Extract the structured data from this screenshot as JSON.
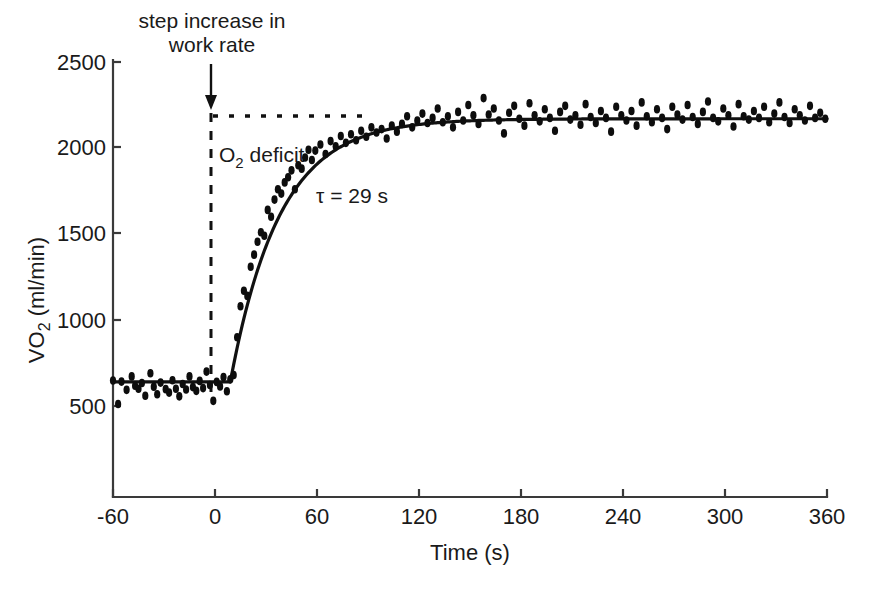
{
  "chart_data": {
    "type": "scatter",
    "title": "",
    "xlabel": "Time (s)",
    "ylabel": "VO2 (ml/min)",
    "ylabel_parts": {
      "main": "VO",
      "sub": "2",
      "units": " (ml/min)"
    },
    "xlim": [
      -60,
      360
    ],
    "ylim": [
      380,
      2560
    ],
    "xticks": [
      -60,
      0,
      60,
      120,
      180,
      240,
      300,
      360
    ],
    "xticklabels": [
      "-60",
      "0",
      "60",
      "120",
      "180",
      "240",
      "300",
      "360"
    ],
    "yticks": [
      500,
      1000,
      1500,
      2000,
      2500
    ],
    "yticklabels": [
      "500",
      "1000",
      "1500",
      "2000",
      "2500"
    ],
    "grid": false,
    "legend": null,
    "series": [
      {
        "name": "VO2 breath-by-breath",
        "marker": "filled-ellipse",
        "color": "#0d0d0d",
        "points": [
          [
            -60,
            648
          ],
          [
            -57,
            512
          ],
          [
            -55,
            642
          ],
          [
            -52,
            594
          ],
          [
            -49,
            672
          ],
          [
            -47,
            618
          ],
          [
            -45,
            600
          ],
          [
            -43,
            634
          ],
          [
            -41,
            560
          ],
          [
            -38,
            690
          ],
          [
            -36,
            612
          ],
          [
            -34,
            568
          ],
          [
            -32,
            636
          ],
          [
            -29,
            598
          ],
          [
            -27,
            578
          ],
          [
            -25,
            650
          ],
          [
            -23,
            600
          ],
          [
            -21,
            556
          ],
          [
            -19,
            628
          ],
          [
            -17,
            596
          ],
          [
            -15,
            672
          ],
          [
            -13,
            610
          ],
          [
            -11,
            588
          ],
          [
            -9,
            646
          ],
          [
            -7,
            604
          ],
          [
            -5,
            700
          ],
          [
            -3,
            622
          ],
          [
            -1,
            530
          ],
          [
            1,
            640
          ],
          [
            3,
            614
          ],
          [
            5,
            668
          ],
          [
            7,
            586
          ],
          [
            9,
            655
          ],
          [
            11,
            680
          ],
          [
            13,
            900
          ],
          [
            15,
            1080
          ],
          [
            17,
            1170
          ],
          [
            19,
            1140
          ],
          [
            21,
            1310
          ],
          [
            23,
            1380
          ],
          [
            25,
            1455
          ],
          [
            27,
            1510
          ],
          [
            29,
            1490
          ],
          [
            31,
            1640
          ],
          [
            33,
            1600
          ],
          [
            35,
            1700
          ],
          [
            37,
            1760
          ],
          [
            39,
            1735
          ],
          [
            41,
            1800
          ],
          [
            43,
            1830
          ],
          [
            45,
            1870
          ],
          [
            47,
            1760
          ],
          [
            49,
            1900
          ],
          [
            51,
            1880
          ],
          [
            53,
            1945
          ],
          [
            55,
            1990
          ],
          [
            57,
            1930
          ],
          [
            59,
            1985
          ],
          [
            62,
            2020
          ],
          [
            65,
            1965
          ],
          [
            68,
            2040
          ],
          [
            71,
            2010
          ],
          [
            74,
            2070
          ],
          [
            77,
            2030
          ],
          [
            80,
            2080
          ],
          [
            83,
            2045
          ],
          [
            86,
            2100
          ],
          [
            89,
            2065
          ],
          [
            92,
            2120
          ],
          [
            95,
            2090
          ],
          [
            98,
            2110
          ],
          [
            101,
            2055
          ],
          [
            104,
            2130
          ],
          [
            107,
            2095
          ],
          [
            110,
            2140
          ],
          [
            113,
            2185
          ],
          [
            116,
            2120
          ],
          [
            119,
            2160
          ],
          [
            122,
            2200
          ],
          [
            125,
            2145
          ],
          [
            128,
            2175
          ],
          [
            131,
            2230
          ],
          [
            134,
            2150
          ],
          [
            137,
            2185
          ],
          [
            140,
            2120
          ],
          [
            143,
            2210
          ],
          [
            146,
            2160
          ],
          [
            149,
            2250
          ],
          [
            152,
            2190
          ],
          [
            155,
            2140
          ],
          [
            158,
            2290
          ],
          [
            161,
            2195
          ],
          [
            164,
            2230
          ],
          [
            167,
            2160
          ],
          [
            170,
            2085
          ],
          [
            173,
            2205
          ],
          [
            176,
            2245
          ],
          [
            179,
            2170
          ],
          [
            182,
            2130
          ],
          [
            185,
            2260
          ],
          [
            188,
            2190
          ],
          [
            191,
            2155
          ],
          [
            194,
            2225
          ],
          [
            197,
            2175
          ],
          [
            200,
            2100
          ],
          [
            203,
            2210
          ],
          [
            206,
            2245
          ],
          [
            209,
            2165
          ],
          [
            212,
            2190
          ],
          [
            215,
            2135
          ],
          [
            218,
            2255
          ],
          [
            221,
            2180
          ],
          [
            224,
            2145
          ],
          [
            227,
            2215
          ],
          [
            230,
            2175
          ],
          [
            233,
            2095
          ],
          [
            236,
            2240
          ],
          [
            239,
            2190
          ],
          [
            242,
            2160
          ],
          [
            245,
            2215
          ],
          [
            248,
            2130
          ],
          [
            251,
            2265
          ],
          [
            254,
            2185
          ],
          [
            257,
            2150
          ],
          [
            260,
            2225
          ],
          [
            263,
            2175
          ],
          [
            266,
            2110
          ],
          [
            269,
            2240
          ],
          [
            272,
            2195
          ],
          [
            275,
            2165
          ],
          [
            278,
            2250
          ],
          [
            281,
            2180
          ],
          [
            284,
            2140
          ],
          [
            287,
            2210
          ],
          [
            290,
            2270
          ],
          [
            293,
            2175
          ],
          [
            296,
            2155
          ],
          [
            299,
            2230
          ],
          [
            302,
            2190
          ],
          [
            305,
            2125
          ],
          [
            308,
            2255
          ],
          [
            311,
            2185
          ],
          [
            314,
            2165
          ],
          [
            317,
            2215
          ],
          [
            320,
            2175
          ],
          [
            323,
            2240
          ],
          [
            326,
            2150
          ],
          [
            329,
            2200
          ],
          [
            332,
            2265
          ],
          [
            335,
            2180
          ],
          [
            338,
            2145
          ],
          [
            341,
            2225
          ],
          [
            344,
            2190
          ],
          [
            347,
            2160
          ],
          [
            350,
            2245
          ],
          [
            353,
            2175
          ],
          [
            356,
            2205
          ],
          [
            359,
            2170
          ]
        ]
      }
    ],
    "fit": {
      "name": "mono-exponential fit",
      "model": "baseline + amplitude * (1 - exp(-(t - td)/tau))",
      "baseline": 640,
      "amplitude": 1530,
      "time_delay": 9,
      "tau": 29,
      "asymptote": 2170,
      "color": "#111111"
    },
    "reference_lines": [
      {
        "name": "step-onset-line",
        "orientation": "vertical",
        "value": 0,
        "style": "dashed",
        "y_from": 380,
        "y_to": 2210
      },
      {
        "name": "steady-state-level-line",
        "orientation": "horizontal",
        "value": 2170,
        "style": "dotted",
        "x_from": 0,
        "x_to": 92
      }
    ],
    "annotations": [
      {
        "name": "step-increase-note",
        "text_line1": "step increase in",
        "text_line2": "work rate",
        "x": 0,
        "y": 2560,
        "arrow": "down"
      },
      {
        "name": "o2-deficit-label",
        "text": "O2 deficit",
        "text_main": "O",
        "text_sub": "2",
        "text_rest": " deficit",
        "x": 8,
        "y": 1960
      },
      {
        "name": "tau-label",
        "text": "τ = 29 s",
        "x": 68,
        "y": 1760
      }
    ]
  }
}
